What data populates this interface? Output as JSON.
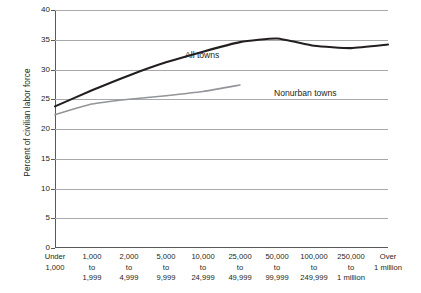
{
  "chart_data": {
    "type": "line",
    "title": "",
    "xlabel": "",
    "ylabel": "Percent of civilian labor force",
    "ylim": [
      0,
      40
    ],
    "ytick_step": 5,
    "yticks": [
      "40",
      "35",
      "30",
      "25",
      "20",
      "15",
      "10",
      "5",
      "0"
    ],
    "grid": true,
    "legend": "inline-labels",
    "categories": [
      "Under|1,000",
      "1,000|to|1,999",
      "2,000|to|4,999",
      "5,000|to|9,999",
      "10,000|to|24,999",
      "25,000|to|49,999",
      "50,000|to|99,999",
      "100,000|to|249,999",
      "250,000|to|1 million",
      "Over|1 million"
    ],
    "series": [
      {
        "name": "All towns",
        "color": "#231f20",
        "values": [
          23.8,
          26.5,
          29.0,
          31.2,
          33.0,
          34.6,
          35.2,
          34.0,
          33.6,
          34.2
        ]
      },
      {
        "name": "Nonurban towns",
        "color": "#939598",
        "values": [
          22.4,
          24.2,
          25.0,
          25.6,
          26.3,
          27.4,
          null,
          null,
          null,
          null
        ]
      }
    ]
  },
  "axis": {
    "y_title": "Percent of civilian labor force",
    "y_labels": [
      "40",
      "35",
      "30",
      "25",
      "20",
      "15",
      "10",
      "5",
      "0"
    ],
    "x_labels": [
      {
        "l1": "Under",
        "l2": "1,000",
        "l3": ""
      },
      {
        "l1": "1,000",
        "l2": "to",
        "l3": "1,999"
      },
      {
        "l1": "2,000",
        "l2": "to",
        "l3": "4,999"
      },
      {
        "l1": "5,000",
        "l2": "to",
        "l3": "9,999"
      },
      {
        "l1": "10,000",
        "l2": "to",
        "l3": "24,999"
      },
      {
        "l1": "25,000",
        "l2": "to",
        "l3": "49,999"
      },
      {
        "l1": "50,000",
        "l2": "to",
        "l3": "99,999"
      },
      {
        "l1": "100,000",
        "l2": "to",
        "l3": "249,999"
      },
      {
        "l1": "250,000",
        "l2": "to",
        "l3": "1 million"
      },
      {
        "l1": "Over",
        "l2": "1 million",
        "l3": ""
      }
    ]
  },
  "labels": {
    "all_towns": "All towns",
    "nonurban_towns": "Nonurban towns"
  },
  "colors": {
    "all_towns_line": "#231f20",
    "nonurban_line": "#939598",
    "gridline": "#a7a9ac",
    "axis": "#58595b",
    "text": "#231f20",
    "background": "#ffffff"
  }
}
